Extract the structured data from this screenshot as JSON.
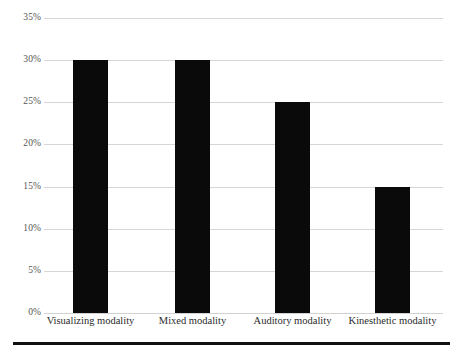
{
  "chart_data": {
    "type": "bar",
    "title": "",
    "subtitle": "",
    "xlabel": "",
    "ylabel": "",
    "categories": [
      "Visualizing modality",
      "Mixed modality",
      "Auditory modality",
      "Kinesthetic modality"
    ],
    "values": [
      30,
      30,
      25,
      15
    ],
    "value_labels": [
      "30%",
      "30%",
      "25%",
      "15%"
    ],
    "ylim": [
      0,
      35
    ],
    "ytick_values": [
      0,
      5,
      10,
      15,
      20,
      25,
      30,
      35
    ],
    "ytick_labels": [
      "0%",
      "5%",
      "10%",
      "15%",
      "20%",
      "25%",
      "30%",
      "35%"
    ],
    "grid": "horizontal",
    "legend": "none",
    "series": [
      {
        "name": "Share of learners",
        "values": [
          30,
          30,
          25,
          15
        ],
        "color": "#0a0a0a"
      }
    ],
    "colors": {
      "bar": "#0a0a0a",
      "gridline": "#d6d6d6",
      "ytick_text": "#555555",
      "xtick_text": "#2b2b2b",
      "background": "#ffffff",
      "bottom_rule": "#111111"
    }
  }
}
